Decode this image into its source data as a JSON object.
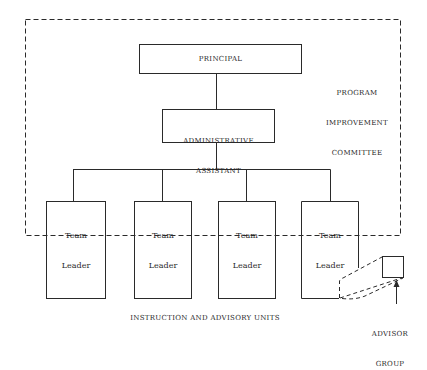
{
  "diagram": {
    "principal": {
      "label": "PRINCIPAL"
    },
    "admin_assistant": {
      "line1": "ADMINISTRATIVE",
      "line2": "ASSISTANT"
    },
    "committee": {
      "line1": "PROGRAM",
      "line2": "IMPROVEMENT",
      "line3": "COMMITTEE"
    },
    "team_leaders": [
      {
        "line1": "Team",
        "line2": "Leader"
      },
      {
        "line1": "Team",
        "line2": "Leader"
      },
      {
        "line1": "Team",
        "line2": "Leader"
      },
      {
        "line1": "Team",
        "line2": "Leader"
      }
    ],
    "units_caption": "INSTRUCTION AND ADVISORY UNITS",
    "advisor_group": {
      "line1": "ADVISOR",
      "line2": "GROUP"
    },
    "colors": {
      "stroke": "#2a2a2a",
      "background": "#ffffff"
    }
  }
}
